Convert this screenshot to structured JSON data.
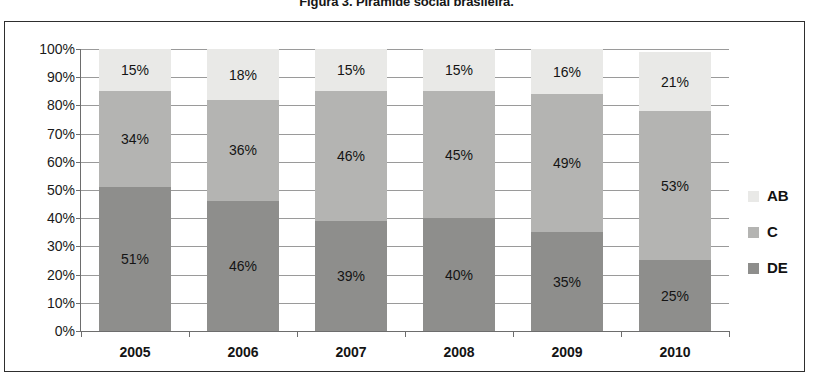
{
  "figure": {
    "caption": "Figura 3. Pirâmide social brasileira."
  },
  "chart_data": {
    "type": "bar",
    "subtype": "stacked-100-percent",
    "title": "Figura 3. Pirâmide social brasileira.",
    "xlabel": "",
    "ylabel": "",
    "ylim": [
      0,
      100
    ],
    "ytick_labels": [
      "100%",
      "90%",
      "80%",
      "70%",
      "60%",
      "50%",
      "40%",
      "30%",
      "20%",
      "10%",
      "0%"
    ],
    "ytick_values": [
      100,
      90,
      80,
      70,
      60,
      50,
      40,
      30,
      20,
      10,
      0
    ],
    "grid": true,
    "legend_position": "right",
    "categories": [
      "2005",
      "2006",
      "2007",
      "2008",
      "2009",
      "2010"
    ],
    "series": [
      {
        "name": "DE",
        "color": "#8e8e8c",
        "values": [
          51,
          46,
          39,
          40,
          35,
          25
        ],
        "labels": [
          "51%",
          "46%",
          "39%",
          "40%",
          "35%",
          "25%"
        ]
      },
      {
        "name": "C",
        "color": "#b4b4b2",
        "values": [
          34,
          36,
          46,
          45,
          49,
          53
        ],
        "labels": [
          "34%",
          "36%",
          "46%",
          "45%",
          "49%",
          "53%"
        ]
      },
      {
        "name": "AB",
        "color": "#e9e9e7",
        "values": [
          15,
          18,
          15,
          15,
          16,
          21
        ],
        "labels": [
          "15%",
          "18%",
          "15%",
          "15%",
          "16%",
          "21%"
        ]
      }
    ],
    "legend_entries": [
      {
        "label": "AB",
        "color": "#e9e9e7"
      },
      {
        "label": "C",
        "color": "#b4b4b2"
      },
      {
        "label": "DE",
        "color": "#8e8e8c"
      }
    ]
  }
}
